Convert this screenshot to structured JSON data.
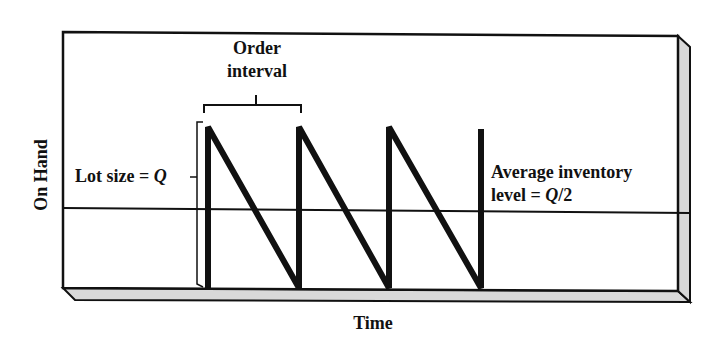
{
  "diagram": {
    "y_axis_label": "On Hand",
    "x_axis_label": "Time",
    "order_interval_label_line1": "Order",
    "order_interval_label_line2": "interval",
    "lot_size_label_prefix": "Lot size = ",
    "lot_size_symbol": "Q",
    "avg_label_line1": "Average inventory",
    "avg_label_line2_prefix": "level = ",
    "avg_label_symbol": "Q",
    "avg_label_suffix": "/2",
    "colors": {
      "line": "#111111",
      "frame_side": "#d9d9d9",
      "background": "#ffffff"
    },
    "cycles": 3
  }
}
